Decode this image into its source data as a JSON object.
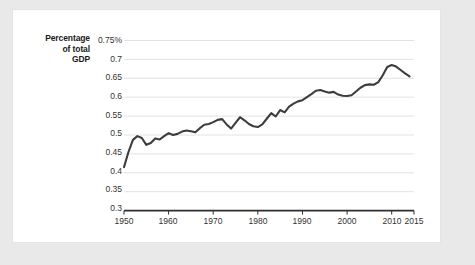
{
  "chart_data": {
    "type": "line",
    "title": "",
    "subtitle": "",
    "xlabel": "",
    "ylabel": "Percentage of total GDP",
    "ylabel_lines": [
      "Percentage",
      "of total",
      "GDP"
    ],
    "xlim": [
      1950,
      2015
    ],
    "ylim": [
      0.3,
      0.75
    ],
    "grid": "horizontal",
    "legend": "none",
    "line_color": "#3d3d3d",
    "gridline_color": "#e2e2e2",
    "axis_color": "#2f2f2f",
    "background_color": "#ffffff",
    "page_background_color": "#e9e9e9",
    "ytick_labels": [
      "0.75%",
      "0.7",
      "0.65",
      "0.6",
      "0.55",
      "0.5",
      "0.45",
      "0.4",
      "0.35",
      "0.3"
    ],
    "ytick_values": [
      0.75,
      0.7,
      0.65,
      0.6,
      0.55,
      0.5,
      0.45,
      0.4,
      0.35,
      0.3
    ],
    "xtick_labels": [
      "1950",
      "1960",
      "1970",
      "1980",
      "1990",
      "2000",
      "2010",
      "2015"
    ],
    "xtick_values": [
      1950,
      1960,
      1970,
      1980,
      1990,
      2000,
      2010,
      2015
    ],
    "x": [
      1950,
      1951,
      1952,
      1953,
      1954,
      1955,
      1956,
      1957,
      1958,
      1959,
      1960,
      1961,
      1962,
      1963,
      1964,
      1965,
      1966,
      1967,
      1968,
      1969,
      1970,
      1971,
      1972,
      1973,
      1974,
      1975,
      1976,
      1977,
      1978,
      1979,
      1980,
      1981,
      1982,
      1983,
      1984,
      1985,
      1986,
      1987,
      1988,
      1989,
      1990,
      1991,
      1992,
      1993,
      1994,
      1995,
      1996,
      1997,
      1998,
      1999,
      2000,
      2001,
      2002,
      2003,
      2004,
      2005,
      2006,
      2007,
      2008,
      2009,
      2010,
      2011,
      2012,
      2013,
      2014
    ],
    "values": [
      0.415,
      0.455,
      0.487,
      0.497,
      0.492,
      0.474,
      0.479,
      0.491,
      0.488,
      0.497,
      0.505,
      0.5,
      0.503,
      0.509,
      0.512,
      0.51,
      0.507,
      0.518,
      0.527,
      0.529,
      0.534,
      0.54,
      0.542,
      0.528,
      0.517,
      0.532,
      0.547,
      0.539,
      0.529,
      0.523,
      0.521,
      0.528,
      0.543,
      0.558,
      0.549,
      0.566,
      0.56,
      0.575,
      0.583,
      0.589,
      0.592,
      0.6,
      0.608,
      0.617,
      0.619,
      0.615,
      0.612,
      0.614,
      0.607,
      0.604,
      0.603,
      0.605,
      0.615,
      0.625,
      0.632,
      0.634,
      0.633,
      0.64,
      0.658,
      0.68,
      0.685,
      0.681,
      0.672,
      0.663,
      0.655
    ]
  }
}
